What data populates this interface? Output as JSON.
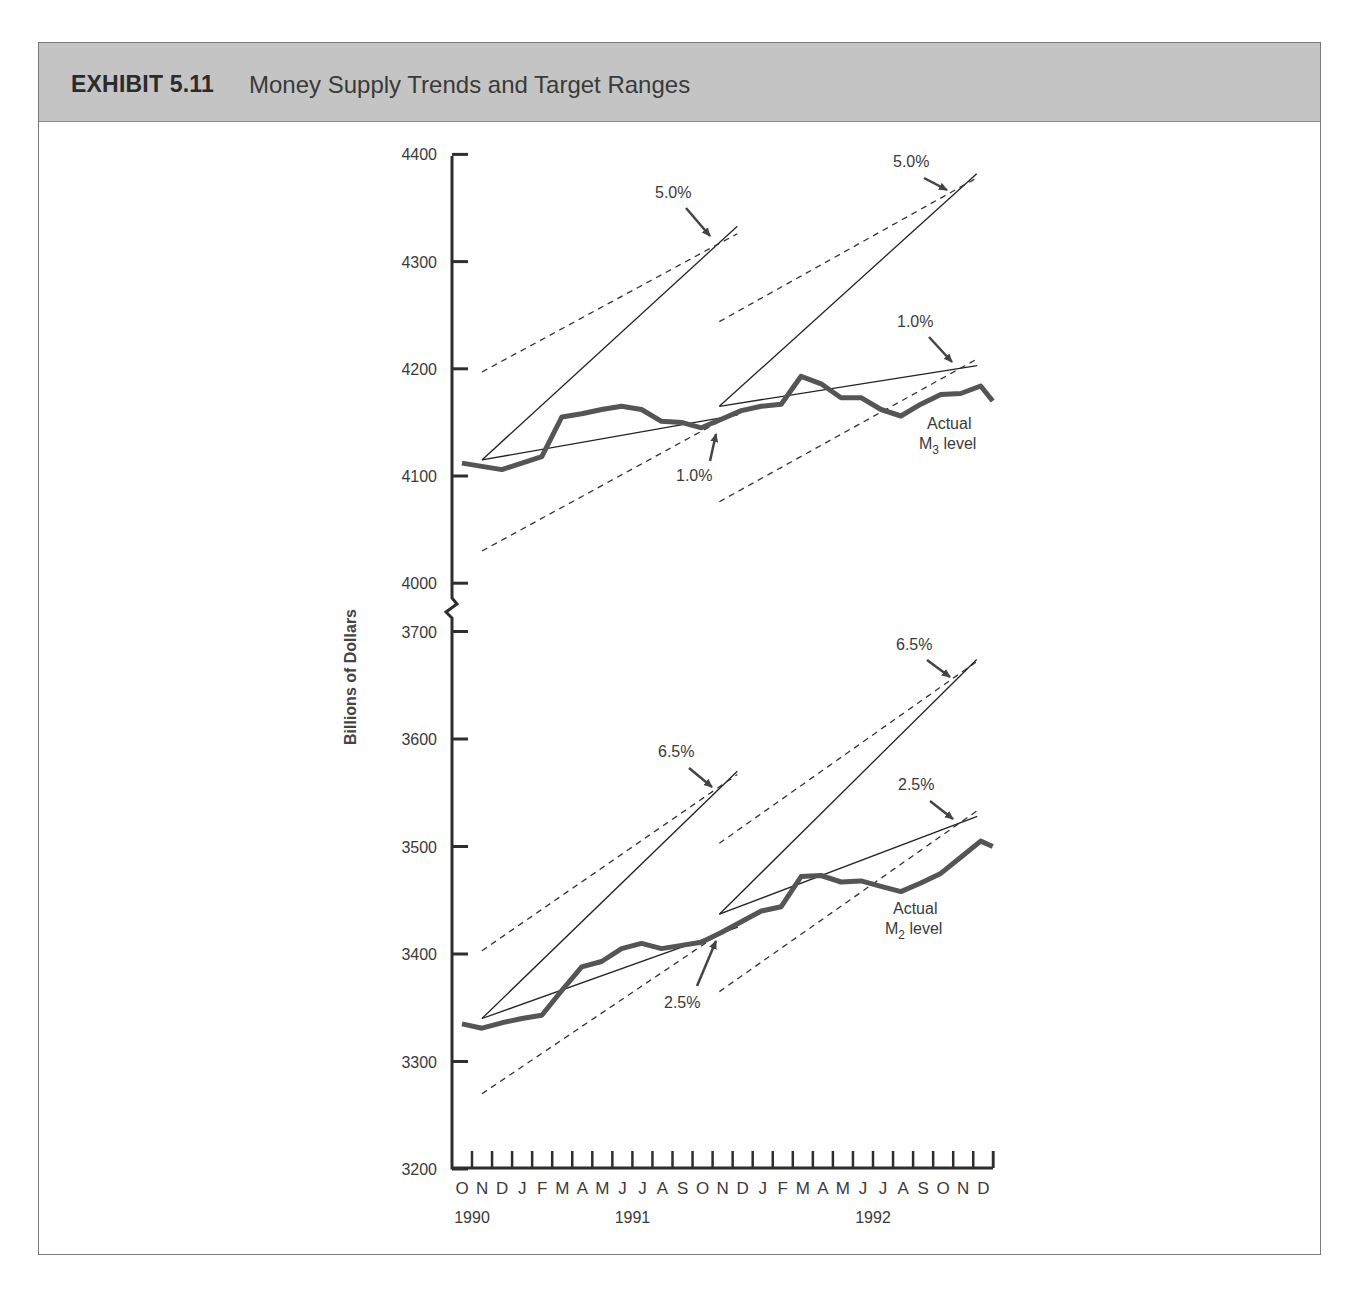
{
  "header": {
    "exhibit": "EXHIBIT 5.11",
    "title": "Money Supply Trends and Target Ranges"
  },
  "colors": {
    "header_bg": "#c4c4c4",
    "series": "#555555",
    "lines": "#333333"
  },
  "chart_data": {
    "type": "line",
    "title": "Money Supply Trends and Target Ranges",
    "xlabel": "",
    "ylabel": "Billions of Dollars",
    "grid": false,
    "axis_break": "between 4000 and 3700",
    "x": [
      "O",
      "N",
      "D",
      "J",
      "F",
      "M",
      "A",
      "M",
      "J",
      "J",
      "A",
      "S",
      "O",
      "N",
      "D",
      "J",
      "F",
      "M",
      "A",
      "M",
      "J",
      "J",
      "A",
      "S",
      "O",
      "N",
      "D"
    ],
    "x_years": [
      {
        "label": "1990",
        "index": 0.5
      },
      {
        "label": "1991",
        "index": 8.5
      },
      {
        "label": "1992",
        "index": 20.5
      }
    ],
    "panels": [
      {
        "name": "M3",
        "ylim": [
          4000,
          4400
        ],
        "yticks": [
          4000,
          4100,
          4200,
          4300,
          4400
        ],
        "series": [
          {
            "name": "Actual M3 level",
            "label_lines": [
              "Actual",
              "M",
              "3",
              " level"
            ],
            "values": [
              4112,
              4109,
              4106,
              4112,
              4118,
              4155,
              4158,
              4162,
              4165,
              4162,
              4151,
              4150,
              4145,
              4153,
              4161,
              4165,
              4167,
              4193,
              4186,
              4173,
              4173,
              4162,
              4156,
              4167,
              4176,
              4177,
              4184
            ]
          },
          {
            "name": "M3 tail",
            "values": [
              4170
            ]
          }
        ],
        "target_ranges": [
          {
            "period": "1991",
            "start_index": 1,
            "end_index": 13.8,
            "start_value": 4115,
            "upper_pct": "5.0%",
            "upper_end": 4333,
            "lower_pct": "1.0%",
            "lower_end": 4157,
            "dashed_upper": [
              4197,
              4326
            ],
            "dashed_lower": [
              4030,
              4160
            ]
          },
          {
            "period": "1992",
            "start_index": 12.9,
            "end_index": 25.8,
            "start_value": 4165,
            "upper_pct": "5.0%",
            "upper_end": 4382,
            "lower_pct": "1.0%",
            "lower_end": 4203,
            "dashed_upper": [
              4244,
              4378
            ],
            "dashed_lower": [
              4076,
              4209
            ]
          }
        ]
      },
      {
        "name": "M2",
        "ylim": [
          3200,
          3700
        ],
        "yticks": [
          3200,
          3300,
          3400,
          3500,
          3600,
          3700
        ],
        "series": [
          {
            "name": "Actual M2 level",
            "label_lines": [
              "Actual",
              "M",
              "2",
              " level"
            ],
            "values": [
              3335,
              3331,
              3336,
              3340,
              3343,
              3366,
              3388,
              3393,
              3405,
              3410,
              3405,
              3408,
              3411,
              3420,
              3430,
              3440,
              3444,
              3472,
              3473,
              3467,
              3468,
              3463,
              3458,
              3466,
              3475,
              3490,
              3505
            ]
          },
          {
            "name": "M2 tail",
            "values": [
              3500
            ]
          }
        ],
        "target_ranges": [
          {
            "period": "1991",
            "start_index": 1,
            "end_index": 13.8,
            "start_value": 3340,
            "upper_pct": "6.5%",
            "upper_end": 3570,
            "lower_pct": "2.5%",
            "lower_end": 3425,
            "dashed_upper": [
              3403,
              3567
            ],
            "dashed_lower": [
              3270,
              3430
            ]
          },
          {
            "period": "1992",
            "start_index": 12.9,
            "end_index": 25.8,
            "start_value": 3437,
            "upper_pct": "6.5%",
            "upper_end": 3674,
            "lower_pct": "2.5%",
            "lower_end": 3528,
            "dashed_upper": [
              3503,
              3672
            ],
            "dashed_lower": [
              3365,
              3533
            ]
          }
        ]
      }
    ],
    "annotations": [
      {
        "text": "5.0%",
        "panel": "M3"
      },
      {
        "text": "1.0%",
        "panel": "M3"
      },
      {
        "text": "5.0%",
        "panel": "M3"
      },
      {
        "text": "1.0%",
        "panel": "M3"
      },
      {
        "text": "6.5%",
        "panel": "M2"
      },
      {
        "text": "2.5%",
        "panel": "M2"
      },
      {
        "text": "6.5%",
        "panel": "M2"
      },
      {
        "text": "2.5%",
        "panel": "M2"
      }
    ]
  },
  "labels": {
    "m3_actual_1": "Actual",
    "m3_actual_2": "M",
    "m3_sub": "3",
    "m3_actual_3": " level",
    "m2_actual_1": "Actual",
    "m2_actual_2": "M",
    "m2_sub": "2",
    "m2_actual_3": " level",
    "ann_m3_1991_upper": "5.0%",
    "ann_m3_1991_lower": "1.0%",
    "ann_m3_1992_upper": "5.0%",
    "ann_m3_1992_lower": "1.0%",
    "ann_m2_1991_upper": "6.5%",
    "ann_m2_1991_lower": "2.5%",
    "ann_m2_1992_upper": "6.5%",
    "ann_m2_1992_lower": "2.5%"
  }
}
